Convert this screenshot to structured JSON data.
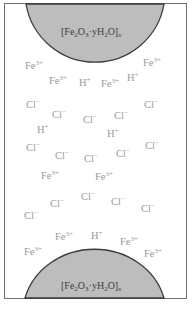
{
  "diagram": {
    "colors": {
      "particle_fill": "#bdbdbd",
      "particle_stroke": "#3a3a3a",
      "ion_text": "#9a9a9a",
      "frame": "#6e6e6e"
    },
    "top_particle": {
      "formula": {
        "pre": "[Fe",
        "s1": "2",
        "mid1": "O",
        "s2": "3",
        "mid2": "·yH",
        "s3": "2",
        "mid3": "O]",
        "x": "x"
      }
    },
    "bottom_particle": {
      "formula": {
        "pre": "[Fe",
        "s1": "2",
        "mid1": "O",
        "s2": "3",
        "mid2": "·yH",
        "s3": "2",
        "mid3": "O]",
        "x": "x"
      }
    },
    "ions": [
      {
        "base": "Fe",
        "charge": "3+",
        "x": 25,
        "y": 60
      },
      {
        "base": "Fe",
        "charge": "3+",
        "x": 143,
        "y": 57
      },
      {
        "base": "Fe",
        "charge": "3+",
        "x": 49,
        "y": 75
      },
      {
        "base": "H",
        "charge": "+",
        "x": 79,
        "y": 77
      },
      {
        "base": "Fe",
        "charge": "3+",
        "x": 101,
        "y": 78
      },
      {
        "base": "H",
        "charge": "+",
        "x": 127,
        "y": 72
      },
      {
        "base": "Cl",
        "charge": "−",
        "x": 26,
        "y": 99
      },
      {
        "base": "Cl",
        "charge": "−",
        "x": 144,
        "y": 99
      },
      {
        "base": "Cl",
        "charge": "−",
        "x": 52,
        "y": 109
      },
      {
        "base": "Cl",
        "charge": "−",
        "x": 83,
        "y": 114
      },
      {
        "base": "Cl",
        "charge": "−",
        "x": 114,
        "y": 110
      },
      {
        "base": "H",
        "charge": "+",
        "x": 37,
        "y": 124
      },
      {
        "base": "H",
        "charge": "+",
        "x": 107,
        "y": 128
      },
      {
        "base": "Cl",
        "charge": "−",
        "x": 26,
        "y": 142
      },
      {
        "base": "Cl",
        "charge": "−",
        "x": 145,
        "y": 140
      },
      {
        "base": "Cl",
        "charge": "−",
        "x": 55,
        "y": 150
      },
      {
        "base": "Cl",
        "charge": "−",
        "x": 84,
        "y": 153
      },
      {
        "base": "Cl",
        "charge": "−",
        "x": 116,
        "y": 148
      },
      {
        "base": "Fe",
        "charge": "3+",
        "x": 41,
        "y": 170
      },
      {
        "base": "Fe",
        "charge": "3+",
        "x": 95,
        "y": 171
      },
      {
        "base": "Cl",
        "charge": "−",
        "x": 81,
        "y": 191
      },
      {
        "base": "Cl",
        "charge": "−",
        "x": 50,
        "y": 198
      },
      {
        "base": "Cl",
        "charge": "−",
        "x": 111,
        "y": 196
      },
      {
        "base": "Cl",
        "charge": "−",
        "x": 24,
        "y": 210
      },
      {
        "base": "Cl",
        "charge": "−",
        "x": 141,
        "y": 203
      },
      {
        "base": "Fe",
        "charge": "3+",
        "x": 55,
        "y": 231
      },
      {
        "base": "H",
        "charge": "+",
        "x": 91,
        "y": 230
      },
      {
        "base": "Fe",
        "charge": "3+",
        "x": 120,
        "y": 236
      },
      {
        "base": "Fe",
        "charge": "3+",
        "x": 24,
        "y": 246
      },
      {
        "base": "Fe",
        "charge": "3+",
        "x": 144,
        "y": 248
      }
    ]
  }
}
